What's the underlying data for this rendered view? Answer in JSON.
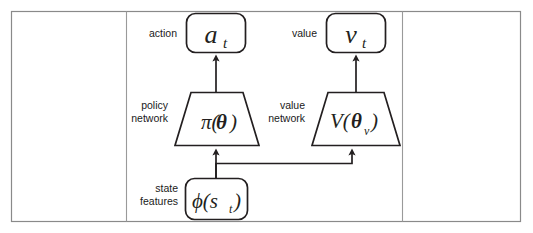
{
  "figure": {
    "type": "actor-critic-architecture-diagram",
    "background_color": "#ffffff",
    "line_color": "#231f20",
    "frame": {
      "border_color": "#8a8a8a",
      "divider_color": "#9a9a9a",
      "x": 11,
      "y": 11,
      "width": 510,
      "height": 211,
      "divider_left_x": 126,
      "divider_right_x": 402
    }
  },
  "labels": {
    "action": "action",
    "value": "value",
    "policy_network_line1": "policy",
    "policy_network_line2": "network",
    "value_network_line1": "value",
    "value_network_line2": "network",
    "state_features_line1": "state",
    "state_features_line2": "features"
  },
  "nodes": {
    "action_output": {
      "text": "a",
      "subscript": "t",
      "shape": "rounded-rect",
      "x": 186,
      "y": 13,
      "width": 59,
      "height": 40
    },
    "value_output": {
      "text": "v",
      "subscript": "t",
      "shape": "rounded-rect",
      "x": 326,
      "y": 13,
      "width": 59,
      "height": 40
    },
    "policy_network": {
      "text": "π(",
      "param": "θ",
      "close": ")",
      "shape": "trapezoid",
      "x": 175,
      "y": 92,
      "top_width": 56,
      "bottom_width": 88,
      "height": 54
    },
    "value_network": {
      "text": "V(",
      "param": "θ",
      "subscript": "v",
      "close": ")",
      "shape": "trapezoid",
      "x": 312,
      "y": 92,
      "top_width": 56,
      "bottom_width": 88,
      "height": 54
    },
    "state_features": {
      "text": "ϕ(s",
      "subscript": "t",
      "close": ")",
      "shape": "rounded-rect",
      "x": 185,
      "y": 178,
      "width": 62,
      "height": 42
    }
  },
  "edges": [
    {
      "name": "policy-to-action",
      "from": "policy_network",
      "to": "action_output",
      "arrow": true
    },
    {
      "name": "value-to-value-output",
      "from": "value_network",
      "to": "value_output",
      "arrow": true
    },
    {
      "name": "state-to-policy",
      "from": "state_features",
      "to": "policy_network",
      "arrow": true
    },
    {
      "name": "state-to-value-network",
      "from": "state_features",
      "to": "value_network",
      "arrow": true
    }
  ]
}
